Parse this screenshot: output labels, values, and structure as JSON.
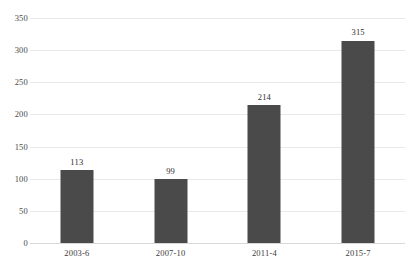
{
  "chart_data": {
    "type": "bar",
    "title": "",
    "subtitle": "",
    "xlabel": "",
    "ylabel": "",
    "categories": [
      "2003-6",
      "2007-10",
      "2011-4",
      "2015-7"
    ],
    "values": [
      113,
      99,
      214,
      315
    ],
    "data_labels": [
      "113",
      "99",
      "214",
      "315"
    ],
    "ylim": [
      0,
      350
    ],
    "ytick_labels": [
      "0",
      "50",
      "100",
      "150",
      "200",
      "250",
      "300",
      "350"
    ],
    "ytick_values": [
      0,
      50,
      100,
      150,
      200,
      250,
      300,
      350
    ],
    "grid": true,
    "grid_axis": "y",
    "legend": false,
    "legend_position": "none",
    "colors": {
      "bar": "#4a4a4a",
      "gridline": "#e9e9e9",
      "baseline": "#d8d8d8",
      "tick_text": "#4a4a4a",
      "label_text": "#2e2e2e",
      "background": "#ffffff"
    }
  }
}
